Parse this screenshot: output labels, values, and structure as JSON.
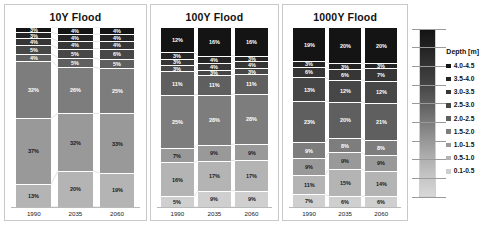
{
  "chart_data": [
    {
      "type": "bar",
      "title": "10Y Flood",
      "xlabel": "",
      "ylabel": "",
      "ylim": [
        0,
        100
      ],
      "stacked": true,
      "grid": false,
      "legend_position": "right",
      "categories": [
        "1990",
        "2035",
        "2060"
      ],
      "series": [
        {
          "name": "4.0-4.5",
          "values": [
            3,
            4,
            4
          ]
        },
        {
          "name": "3.5-4.0",
          "values": [
            3,
            4,
            4
          ]
        },
        {
          "name": "3.0-3.5",
          "values": [
            4,
            4,
            4
          ]
        },
        {
          "name": "2.5-3.0",
          "values": [
            5,
            5,
            6
          ]
        },
        {
          "name": "2.0-2.5",
          "values": [
            4,
            5,
            5
          ]
        },
        {
          "name": "1.5-2.0",
          "values": [
            32,
            26,
            25
          ]
        },
        {
          "name": "1.0-1.5",
          "values": [
            37,
            32,
            33
          ]
        },
        {
          "name": "0.5-1.0",
          "values": [
            13,
            20,
            19
          ]
        },
        {
          "name": "0.1-0.5",
          "values": [
            0,
            0,
            0
          ]
        }
      ]
    },
    {
      "type": "bar",
      "title": "100Y Flood",
      "xlabel": "",
      "ylabel": "",
      "ylim": [
        0,
        100
      ],
      "stacked": true,
      "grid": false,
      "legend_position": "right",
      "categories": [
        "1990",
        "2035",
        "2060"
      ],
      "series": [
        {
          "name": "4.0-4.5",
          "values": [
            12,
            16,
            16
          ]
        },
        {
          "name": "3.5-4.0",
          "values": [
            3,
            4,
            3
          ]
        },
        {
          "name": "3.0-3.5",
          "values": [
            3,
            4,
            4
          ]
        },
        {
          "name": "2.5-3.0",
          "values": [
            3,
            3,
            3
          ]
        },
        {
          "name": "2.0-2.5",
          "values": [
            11,
            11,
            11
          ]
        },
        {
          "name": "1.5-2.0",
          "values": [
            25,
            28,
            28
          ]
        },
        {
          "name": "1.0-1.5",
          "values": [
            7,
            9,
            9
          ]
        },
        {
          "name": "0.5-1.0",
          "values": [
            16,
            17,
            17
          ]
        },
        {
          "name": "0.1-0.5",
          "values": [
            5,
            9,
            9
          ]
        }
      ]
    },
    {
      "type": "bar",
      "title": "1000Y Flood",
      "xlabel": "",
      "ylabel": "",
      "ylim": [
        0,
        100
      ],
      "stacked": true,
      "grid": false,
      "legend_position": "right",
      "categories": [
        "1990",
        "2035",
        "2060"
      ],
      "series": [
        {
          "name": "4.0-4.5",
          "values": [
            19,
            20,
            20
          ]
        },
        {
          "name": "3.5-4.0",
          "values": [
            3,
            3,
            3
          ]
        },
        {
          "name": "3.0-3.5",
          "values": [
            6,
            6,
            7
          ]
        },
        {
          "name": "2.5-3.0",
          "values": [
            13,
            12,
            12
          ]
        },
        {
          "name": "2.0-2.5",
          "values": [
            23,
            20,
            21
          ]
        },
        {
          "name": "1.5-2.0",
          "values": [
            9,
            8,
            8
          ]
        },
        {
          "name": "1.0-1.5",
          "values": [
            9,
            9,
            9
          ]
        },
        {
          "name": "0.5-1.0",
          "values": [
            11,
            15,
            14
          ]
        },
        {
          "name": "0.1-0.5",
          "values": [
            7,
            6,
            6
          ]
        }
      ]
    }
  ],
  "legend": {
    "title": "Depth [m]",
    "items": [
      {
        "label": "4.0-4.5",
        "color": "#141414"
      },
      {
        "label": "3.5-4.0",
        "color": "#242424"
      },
      {
        "label": "3.0-3.5",
        "color": "#363636"
      },
      {
        "label": "2.5-3.0",
        "color": "#474747"
      },
      {
        "label": "2.0-2.5",
        "color": "#5f5f5f"
      },
      {
        "label": "1.5-2.0",
        "color": "#7d7d7d"
      },
      {
        "label": "1.0-1.5",
        "color": "#999999"
      },
      {
        "label": "0.5-1.0",
        "color": "#b4b4b4"
      },
      {
        "label": "0.1-0.5",
        "color": "#cfcfcf"
      }
    ]
  },
  "panels": [
    {
      "title": "10Y Flood"
    },
    {
      "title": "100Y Flood"
    },
    {
      "title": "1000Y Flood"
    }
  ]
}
